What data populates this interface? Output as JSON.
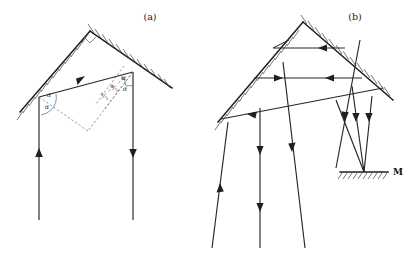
{
  "figure": {
    "caption_a": "(a)",
    "caption_b": "(b)",
    "background_color": "#ffffff",
    "ink_color": "#262626",
    "dash_color": "#6e6e6e"
  },
  "panel_a": {
    "label": "(a)",
    "apex_marker": "right-angle",
    "angle_labels": [
      {
        "text": "α",
        "role": "incidence-angle-upper-left"
      },
      {
        "text": "α",
        "role": "reflection-angle-lower-left"
      },
      {
        "text": "α",
        "role": "incidence-angle-upper-right"
      },
      {
        "text": "α",
        "role": "reflection-angle-lower-right"
      }
    ],
    "fraction_labels": [
      {
        "numerator": "π",
        "denominator": "2",
        "suffix": "− α",
        "text": "π/2 − α",
        "role": "normal-angle-left"
      },
      {
        "numerator": "π",
        "denominator": "2",
        "suffix": "− α",
        "text": "π/2 − α",
        "role": "normal-angle-right"
      }
    ],
    "rays": [
      {
        "name": "incoming-vertical-left",
        "direction": "up"
      },
      {
        "name": "horizontal-transfer",
        "direction": "right"
      },
      {
        "name": "outgoing-vertical-right",
        "direction": "down"
      }
    ],
    "mirrors": [
      {
        "name": "left-mirror-face",
        "hatched": true
      },
      {
        "name": "right-mirror-face",
        "hatched": true
      }
    ]
  },
  "panel_b": {
    "label": "(b)",
    "mirror_label": "M",
    "mirrors": [
      {
        "name": "left-mirror-face",
        "hatched": true
      },
      {
        "name": "right-mirror-face",
        "hatched": true
      },
      {
        "name": "bottom-mirror-M",
        "hatched": true
      }
    ],
    "rays": [
      {
        "name": "ray-up-left-outer",
        "direction": "up"
      },
      {
        "name": "ray-down-left-inner",
        "direction": "down"
      },
      {
        "name": "ray-down-center",
        "direction": "down"
      },
      {
        "name": "ray-down-right",
        "direction": "down"
      },
      {
        "name": "ray-horizontal-upper",
        "direction": "left"
      },
      {
        "name": "ray-horizontal-middle-right",
        "direction": "right"
      },
      {
        "name": "ray-horizontal-middle-left",
        "direction": "left"
      },
      {
        "name": "ray-diagonal-lower",
        "direction": "left"
      },
      {
        "name": "ray-converge-up",
        "direction": "up"
      },
      {
        "name": "ray-converge-down",
        "direction": "down"
      }
    ]
  }
}
